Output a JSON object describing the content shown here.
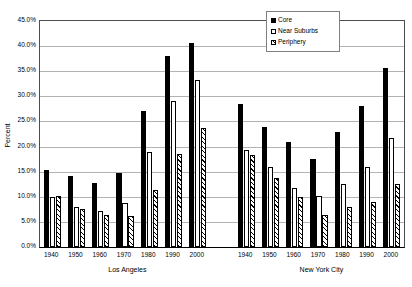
{
  "chart_data": {
    "type": "bar",
    "title": "",
    "xlabel": "",
    "ylabel": "Percent",
    "ylim": [
      0,
      45
    ],
    "ytick_labels": [
      "0.0%",
      "5.0%",
      "10.0%",
      "15.0%",
      "20.0%",
      "25.0%",
      "30.0%",
      "35.0%",
      "40.0%",
      "45.0%"
    ],
    "ytick_values": [
      0,
      5,
      10,
      15,
      20,
      25,
      30,
      35,
      40,
      45
    ],
    "grid": true,
    "legend_position": "top-right",
    "legend": [
      "Core",
      "Near Suburbs",
      "Periphery"
    ],
    "group_labels": [
      "Los Angeles",
      "New York City"
    ],
    "categories": [
      "1940",
      "1950",
      "1960",
      "1970",
      "1980",
      "1990",
      "2000"
    ],
    "groups": [
      {
        "name": "Los Angeles",
        "categories": [
          "1940",
          "1950",
          "1960",
          "1970",
          "1980",
          "1990",
          "2000"
        ],
        "series": [
          {
            "name": "Core",
            "values": [
              15.3,
              14.1,
              12.7,
              14.7,
              27.0,
              38.0,
              40.6
            ]
          },
          {
            "name": "Near Suburbs",
            "values": [
              9.9,
              8.0,
              7.2,
              8.7,
              18.9,
              29.0,
              33.3
            ]
          },
          {
            "name": "Periphery",
            "values": [
              10.1,
              7.6,
              6.4,
              6.1,
              11.4,
              18.6,
              23.6
            ]
          }
        ]
      },
      {
        "name": "New York City",
        "categories": [
          "1940",
          "1950",
          "1960",
          "1970",
          "1980",
          "1990",
          "2000"
        ],
        "series": [
          {
            "name": "Core",
            "values": [
              28.4,
              23.9,
              21.0,
              17.6,
              23.0,
              28.1,
              35.6
            ]
          },
          {
            "name": "Near Suburbs",
            "values": [
              19.3,
              15.9,
              11.7,
              10.2,
              12.6,
              16.0,
              21.7
            ]
          },
          {
            "name": "Periphery",
            "values": [
              18.3,
              13.8,
              9.9,
              6.4,
              8.0,
              9.0,
              12.5
            ]
          }
        ]
      }
    ],
    "colors": {
      "core": "#000000",
      "near_suburbs": "#ffffff",
      "periphery": "#ffffff",
      "outline": "#000000",
      "gridline": "#b3b3b3",
      "axis": "#000000",
      "background": "#ffffff"
    }
  }
}
